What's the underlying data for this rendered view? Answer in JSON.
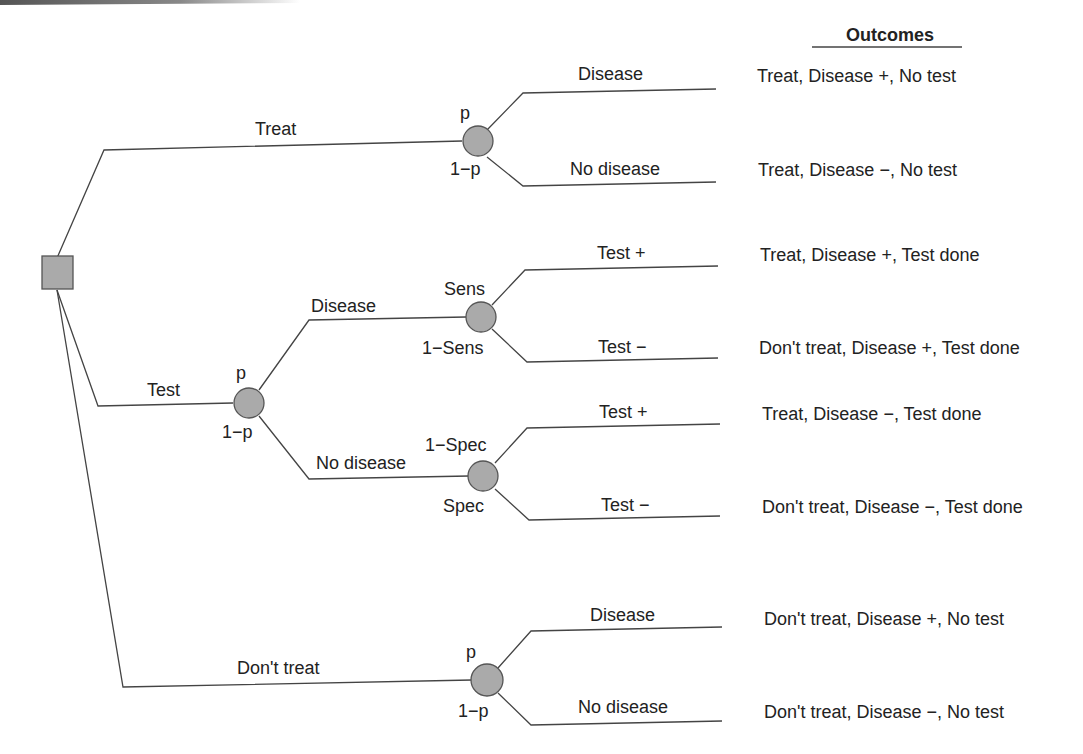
{
  "outcomes_header": "Outcomes",
  "decision_node": {
    "shape": "square",
    "color": "#aaaaaa"
  },
  "branches": {
    "treat": {
      "label": "Treat",
      "p_label": "p",
      "q_label": "1−p",
      "upper": "Disease",
      "lower": "No disease"
    },
    "test": {
      "label": "Test",
      "p_label": "p",
      "q_label": "1−p",
      "disease": {
        "label": "Disease",
        "upper_prob": "Sens",
        "lower_prob": "1−Sens",
        "upper": "Test +",
        "lower": "Test −"
      },
      "no_disease": {
        "label": "No disease",
        "upper_prob": "1−Spec",
        "lower_prob": "Spec",
        "upper": "Test +",
        "lower": "Test −"
      }
    },
    "dont_treat": {
      "label": "Don't treat",
      "p_label": "p",
      "q_label": "1−p",
      "upper": "Disease",
      "lower": "No disease"
    }
  },
  "outcomes": [
    "Treat, Disease +, No test",
    "Treat, Disease −, No test",
    "Treat, Disease +, Test done",
    "Don't treat, Disease +, Test done",
    "Treat, Disease −, Test done",
    "Don't treat, Disease −, Test done",
    "Don't treat, Disease +, No test",
    "Don't treat, Disease −, No test"
  ],
  "colors": {
    "node_fill": "#aaaaaa",
    "line": "#444444",
    "text": "#222222"
  }
}
